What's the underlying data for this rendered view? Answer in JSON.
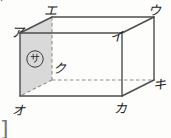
{
  "figure": {
    "kind": "rectangular-prism-diagram",
    "shaded_face_fill": "#d9d9d9",
    "solid_edge_color": "#4d4d4d",
    "hidden_edge_color": "#8a8a8a",
    "background_color": "#fdfdfc",
    "vertices": [
      {
        "name": "a",
        "label": "ア",
        "x": 20,
        "y": 33,
        "tx": 11,
        "ty": 26
      },
      {
        "name": "e",
        "label": "エ",
        "x": 52,
        "y": 17,
        "tx": 44,
        "ty": 4
      },
      {
        "name": "u",
        "label": "ウ",
        "x": 154,
        "y": 17,
        "tx": 148,
        "ty": 4
      },
      {
        "name": "i",
        "label": "イ",
        "x": 122,
        "y": 33,
        "tx": 110,
        "ty": 30
      },
      {
        "name": "o",
        "label": "オ",
        "x": 20,
        "y": 96,
        "tx": 12,
        "ty": 104
      },
      {
        "name": "ku",
        "label": "ク",
        "x": 52,
        "y": 80,
        "tx": 53,
        "ty": 62
      },
      {
        "name": "ka",
        "label": "カ",
        "x": 122,
        "y": 96,
        "tx": 114,
        "ty": 102
      },
      {
        "name": "ki",
        "label": "キ",
        "x": 154,
        "y": 80,
        "tx": 153,
        "ty": 78
      }
    ],
    "solid_edges": [
      {
        "name": "edge-a-e",
        "from": "a",
        "to": "e"
      },
      {
        "name": "edge-e-u",
        "from": "e",
        "to": "u"
      },
      {
        "name": "edge-u-i",
        "from": "u",
        "to": "i"
      },
      {
        "name": "edge-i-a",
        "from": "i",
        "to": "a"
      },
      {
        "name": "edge-a-o",
        "from": "a",
        "to": "o"
      },
      {
        "name": "edge-i-ka",
        "from": "i",
        "to": "ka"
      },
      {
        "name": "edge-u-ki",
        "from": "u",
        "to": "ki"
      },
      {
        "name": "edge-o-ka",
        "from": "o",
        "to": "ka"
      },
      {
        "name": "edge-ka-ki",
        "from": "ka",
        "to": "ki"
      },
      {
        "name": "edge-e-ku",
        "from": "e",
        "to": "ku"
      }
    ],
    "hidden_edges": [
      {
        "name": "hidden-edge-e-ku",
        "from": "e",
        "to": "ku"
      },
      {
        "name": "hidden-edge-ku-o",
        "from": "ku",
        "to": "o"
      },
      {
        "name": "hidden-edge-ku-ka",
        "from": "ku",
        "to": "ka"
      }
    ],
    "shaded_face": {
      "name": "shaded-face-a-e-ku-o",
      "points": "20,33 52,17 52,80 20,96",
      "tag_label": "サ",
      "tag_x": 30,
      "tag_y": 54
    },
    "corner_fragment": {
      "label": "⌐",
      "note": "partial glyph cropped at top-left edge"
    },
    "bottom_bracket": {
      "label": "]",
      "note": "partial rounded bracket cropped at bottom-left edge"
    }
  }
}
